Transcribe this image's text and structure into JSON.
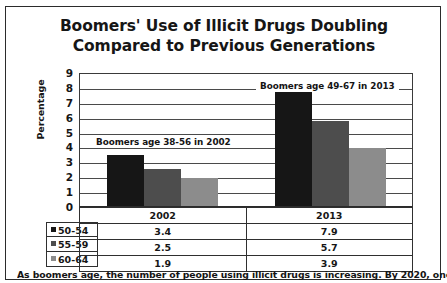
{
  "title": {
    "line1": "Boomers' Use of Illicit Drugs Doubling",
    "line2": "Compared to Previous Generations"
  },
  "caption": "As boomers age, the number of people using illicit drugs is increasing. By 2020, one in",
  "chart_data": {
    "type": "bar",
    "title": "Boomers' Use of Illicit Drugs Doubling Compared to Previous Generations",
    "xlabel": "",
    "ylabel": "Percentage",
    "categories": [
      "2002",
      "2013"
    ],
    "series": [
      {
        "name": "50-54",
        "values": [
          3.4,
          7.9
        ],
        "color": "#161616"
      },
      {
        "name": "55-59",
        "values": [
          2.5,
          5.7
        ],
        "color": "#4d4d4d"
      },
      {
        "name": "60-64",
        "values": [
          1.9,
          3.9
        ],
        "color": "#8c8c8c"
      }
    ],
    "ylim": [
      0,
      9
    ],
    "yticks": [
      0,
      1,
      2,
      3,
      4,
      5,
      6,
      7,
      8,
      9
    ],
    "ytick_labels": [
      "0",
      "1",
      "2",
      "3",
      "4",
      "5",
      "6",
      "7",
      "8",
      "9"
    ],
    "grid": true,
    "legend_position": "table",
    "annotations": [
      {
        "text": "Boomers age 38-56 in 2002",
        "group": "2002"
      },
      {
        "text": "Boomers age 49-67 in 2013",
        "group": "2013"
      }
    ]
  },
  "table": {
    "corner": "",
    "columns": [
      "2002",
      "2013"
    ],
    "rows": [
      {
        "label": "50-54",
        "values": [
          "3.4",
          "7.9"
        ]
      },
      {
        "label": "55-59",
        "values": [
          "2.5",
          "5.7"
        ]
      },
      {
        "label": "60-64",
        "values": [
          "1.9",
          "3.9"
        ]
      }
    ]
  }
}
